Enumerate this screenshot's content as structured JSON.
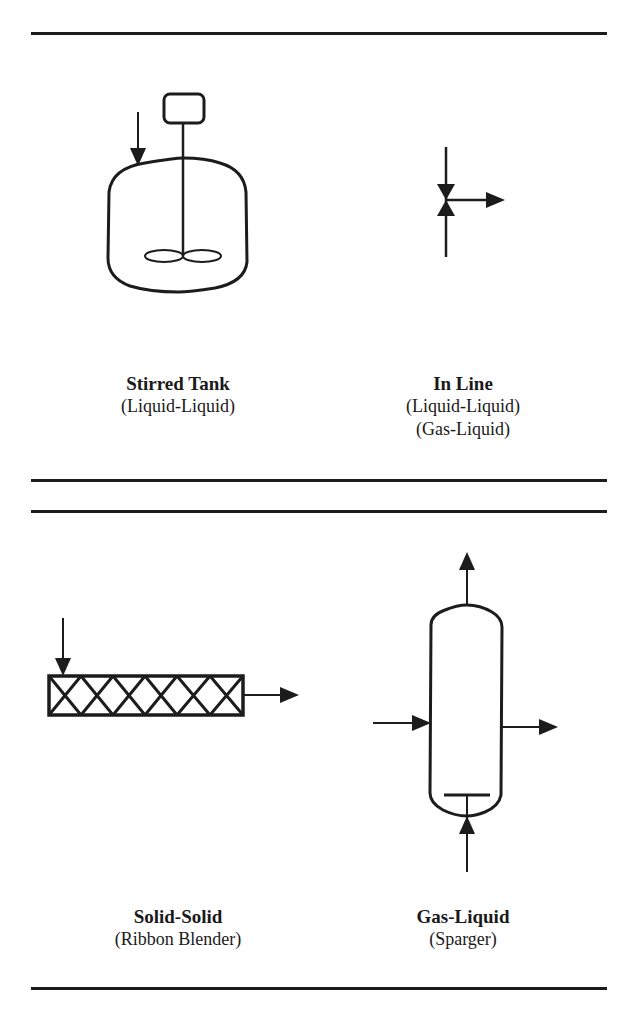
{
  "figure": {
    "title_partial": "Examples of Mixers (continued)",
    "panels": [
      {
        "id": "stirred-tank",
        "title": "Stirred Tank",
        "subtitles": [
          "(Liquid-Liquid)"
        ]
      },
      {
        "id": "in-line",
        "title": "In Line",
        "subtitles": [
          "(Liquid-Liquid)",
          "(Gas-Liquid)"
        ]
      },
      {
        "id": "solid-solid",
        "title": "Solid-Solid",
        "subtitles": [
          "(Ribbon Blender)"
        ]
      },
      {
        "id": "gas-liquid",
        "title": "Gas-Liquid",
        "subtitles": [
          "(Sparger)"
        ]
      }
    ],
    "colors": {
      "ink": "#1c1c1c",
      "background": "#ffffff"
    }
  }
}
